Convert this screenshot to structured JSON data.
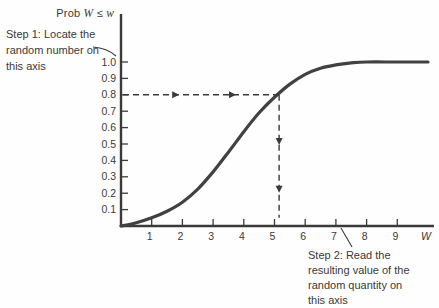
{
  "labels": {
    "y_title_prefix": "Prob ",
    "y_title_var1": "W",
    "y_title_op": " ≤ ",
    "y_title_var2": "w"
  },
  "annotations": {
    "step1": "Step 1: Locate the\nrandom number on\nthis axis",
    "step2": "Step 2: Read the\nresulting value of the\nrandom quantity on\nthis axis"
  },
  "colors": {
    "ink": "#3a3a3a",
    "curve": "#414141",
    "background": "#fefefe"
  },
  "chart_data": {
    "type": "line",
    "title": "",
    "xlabel": "W",
    "ylabel": "Prob W ≤ w",
    "xlim": [
      0,
      10.2
    ],
    "ylim": [
      0,
      1.3
    ],
    "grid": false,
    "x_ticks": [
      "1",
      "2",
      "3",
      "4",
      "5",
      "6",
      "7",
      "8",
      "9"
    ],
    "y_ticks": [
      "0.1",
      "0.2",
      "0.3",
      "0.4",
      "0.5",
      "0.6",
      "0.7",
      "0.8",
      "0.9",
      "1.0"
    ],
    "series": [
      {
        "name": "CDF curve",
        "points": [
          [
            0,
            0
          ],
          [
            0.5,
            0.02
          ],
          [
            1,
            0.05
          ],
          [
            1.5,
            0.09
          ],
          [
            2,
            0.145
          ],
          [
            2.5,
            0.225
          ],
          [
            3,
            0.33
          ],
          [
            3.5,
            0.45
          ],
          [
            4,
            0.575
          ],
          [
            4.5,
            0.69
          ],
          [
            5,
            0.785
          ],
          [
            5.5,
            0.865
          ],
          [
            6,
            0.925
          ],
          [
            6.5,
            0.962
          ],
          [
            7,
            0.983
          ],
          [
            7.5,
            0.995
          ],
          [
            8,
            1.0
          ],
          [
            9,
            1.0
          ],
          [
            10,
            1.0
          ]
        ]
      }
    ],
    "guide": {
      "p": 0.8,
      "w": 5.15,
      "horizontal_arrowheads_at_w": [
        1.7,
        3.55
      ],
      "vertical_arrowheads_at_p": [
        0.53,
        0.24
      ],
      "vertical_end_p": 0.05
    }
  }
}
